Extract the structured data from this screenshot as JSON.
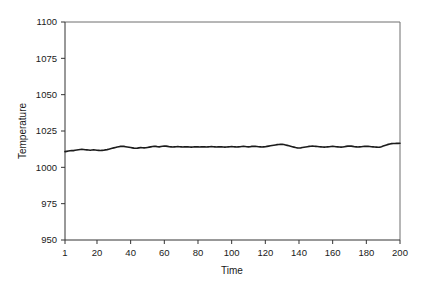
{
  "chart_data": {
    "type": "line",
    "title": "",
    "xlabel": "Time",
    "ylabel": "Temperature",
    "xlim": [
      1,
      200
    ],
    "ylim": [
      950,
      1100
    ],
    "grid": false,
    "legend": null,
    "x_ticks": [
      1,
      20,
      40,
      60,
      80,
      100,
      120,
      140,
      160,
      180,
      200
    ],
    "x_tick_labels": [
      "1",
      "20",
      "40",
      "60",
      "80",
      "100",
      "120",
      "140",
      "160",
      "180",
      "200"
    ],
    "y_ticks": [
      950,
      975,
      1000,
      1025,
      1050,
      1075,
      1100
    ],
    "y_tick_labels": [
      "950",
      "975",
      "1000",
      "1025",
      "1050",
      "1075",
      "1100"
    ],
    "series": [
      {
        "name": "Temperature",
        "color": "#1c1c1c",
        "x": [
          1,
          2,
          3,
          4,
          5,
          6,
          7,
          8,
          9,
          10,
          11,
          12,
          13,
          14,
          15,
          16,
          17,
          18,
          19,
          20,
          21,
          22,
          23,
          24,
          25,
          26,
          27,
          28,
          29,
          30,
          31,
          32,
          33,
          34,
          35,
          36,
          37,
          38,
          39,
          40,
          41,
          42,
          43,
          44,
          45,
          46,
          47,
          48,
          49,
          50,
          51,
          52,
          53,
          54,
          55,
          56,
          57,
          58,
          59,
          60,
          61,
          62,
          63,
          64,
          65,
          66,
          67,
          68,
          69,
          70,
          71,
          72,
          73,
          74,
          75,
          76,
          77,
          78,
          79,
          80,
          81,
          82,
          83,
          84,
          85,
          86,
          87,
          88,
          89,
          90,
          91,
          92,
          93,
          94,
          95,
          96,
          97,
          98,
          99,
          100,
          101,
          102,
          103,
          104,
          105,
          106,
          107,
          108,
          109,
          110,
          111,
          112,
          113,
          114,
          115,
          116,
          117,
          118,
          119,
          120,
          121,
          122,
          123,
          124,
          125,
          126,
          127,
          128,
          129,
          130,
          131,
          132,
          133,
          134,
          135,
          136,
          137,
          138,
          139,
          140,
          141,
          142,
          143,
          144,
          145,
          146,
          147,
          148,
          149,
          150,
          151,
          152,
          153,
          154,
          155,
          156,
          157,
          158,
          159,
          160,
          161,
          162,
          163,
          164,
          165,
          166,
          167,
          168,
          169,
          170,
          171,
          172,
          173,
          174,
          175,
          176,
          177,
          178,
          179,
          180,
          181,
          182,
          183,
          184,
          185,
          186,
          187,
          188,
          189,
          190,
          191,
          192,
          193,
          194,
          195,
          196,
          197,
          198,
          199,
          200
        ],
        "values": [
          1010.8,
          1011.0,
          1011.2,
          1011.4,
          1011.6,
          1011.5,
          1011.7,
          1011.9,
          1012.1,
          1012.3,
          1012.4,
          1012.3,
          1012.1,
          1012.0,
          1011.9,
          1011.8,
          1011.9,
          1012.0,
          1011.9,
          1011.8,
          1011.7,
          1011.6,
          1011.7,
          1011.8,
          1012.0,
          1012.2,
          1012.5,
          1012.8,
          1013.1,
          1013.4,
          1013.7,
          1014.0,
          1014.2,
          1014.4,
          1014.5,
          1014.4,
          1014.2,
          1014.0,
          1013.8,
          1013.6,
          1013.4,
          1013.2,
          1013.1,
          1013.2,
          1013.4,
          1013.6,
          1013.5,
          1013.4,
          1013.5,
          1013.7,
          1013.9,
          1014.1,
          1014.3,
          1014.5,
          1014.4,
          1014.2,
          1014.1,
          1014.3,
          1014.5,
          1014.7,
          1014.6,
          1014.4,
          1014.2,
          1014.1,
          1014.0,
          1014.1,
          1014.2,
          1014.3,
          1014.2,
          1014.1,
          1014.0,
          1014.1,
          1014.2,
          1014.1,
          1014.0,
          1013.9,
          1014.0,
          1014.1,
          1014.2,
          1014.1,
          1014.0,
          1014.1,
          1014.2,
          1014.1,
          1014.0,
          1014.1,
          1014.2,
          1014.3,
          1014.2,
          1014.1,
          1014.0,
          1014.1,
          1014.2,
          1014.1,
          1014.0,
          1013.9,
          1014.0,
          1014.1,
          1014.2,
          1014.3,
          1014.2,
          1014.1,
          1014.0,
          1014.1,
          1014.2,
          1014.3,
          1014.4,
          1014.3,
          1014.2,
          1014.1,
          1014.2,
          1014.4,
          1014.5,
          1014.4,
          1014.3,
          1014.2,
          1014.1,
          1014.0,
          1014.1,
          1014.2,
          1014.4,
          1014.6,
          1014.8,
          1015.0,
          1015.2,
          1015.4,
          1015.6,
          1015.7,
          1015.8,
          1015.9,
          1015.7,
          1015.4,
          1015.1,
          1014.8,
          1014.5,
          1014.2,
          1013.9,
          1013.6,
          1013.4,
          1013.3,
          1013.4,
          1013.6,
          1013.8,
          1014.0,
          1014.2,
          1014.4,
          1014.5,
          1014.6,
          1014.5,
          1014.4,
          1014.3,
          1014.2,
          1014.1,
          1014.0,
          1013.9,
          1014.0,
          1014.1,
          1014.2,
          1014.3,
          1014.4,
          1014.3,
          1014.2,
          1014.1,
          1014.0,
          1013.9,
          1014.0,
          1014.2,
          1014.4,
          1014.6,
          1014.7,
          1014.6,
          1014.4,
          1014.2,
          1014.1,
          1014.0,
          1014.1,
          1014.2,
          1014.3,
          1014.4,
          1014.5,
          1014.4,
          1014.3,
          1014.2,
          1014.1,
          1014.0,
          1013.9,
          1013.8,
          1013.9,
          1014.2,
          1014.6,
          1015.0,
          1015.4,
          1015.8,
          1016.1,
          1016.3,
          1016.4,
          1016.4,
          1016.5,
          1016.5,
          1016.6
        ]
      }
    ]
  },
  "axes": {
    "x_title": "Time",
    "y_title": "Temperature"
  }
}
